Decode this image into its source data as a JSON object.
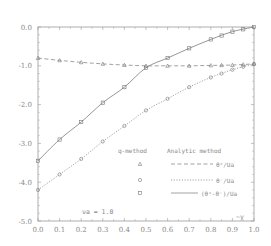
{
  "chart_data": {
    "type": "line",
    "title": "",
    "xlabel": "y",
    "xlabel_display": "~y",
    "ylabel": "",
    "xlim": [
      0.0,
      1.0
    ],
    "ylim": [
      -5.0,
      0.0
    ],
    "grid": false,
    "x_ticks": [
      "0.0",
      "0.1",
      "0.2",
      "0.3",
      "0.4",
      "0.5",
      "0.6",
      "0.7",
      "0.8",
      "0.9",
      "1.0"
    ],
    "y_ticks": [
      "0.0",
      "-1.0",
      "-2.0",
      "-3.0",
      "-4.0",
      "-5.0"
    ],
    "annotation": "νa = 1.0",
    "legend": {
      "position": "lower right",
      "header_left": "q-method",
      "header_right": "Analytic method",
      "entries": [
        {
          "marker": "triangle",
          "line": "dashed",
          "label": "θ⁺/Ua"
        },
        {
          "marker": "circle",
          "line": "dotted",
          "label": "θ⁻/Ua"
        },
        {
          "marker": "square",
          "line": "solid",
          "label": "(θ⁺-θ⁻)/Ua"
        }
      ]
    },
    "x": [
      0.0,
      0.1,
      0.2,
      0.3,
      0.4,
      0.5,
      0.6,
      0.7,
      0.8,
      0.9,
      1.0
    ],
    "series": [
      {
        "name": "θ⁺/Ua",
        "style": "dashed",
        "marker": "triangle",
        "values": [
          -0.8,
          -0.86,
          -0.91,
          -0.95,
          -0.98,
          -1.0,
          -1.0,
          -1.0,
          -0.99,
          -0.98,
          -0.95
        ]
      },
      {
        "name": "θ⁻/Ua",
        "style": "dotted",
        "marker": "circle",
        "values": [
          -4.2,
          -3.8,
          -3.4,
          -2.95,
          -2.55,
          -2.15,
          -1.85,
          -1.55,
          -1.3,
          -1.1,
          -0.95
        ]
      },
      {
        "name": "(θ⁺-θ⁻)/Ua",
        "style": "solid",
        "marker": "square",
        "values": [
          -3.45,
          -2.9,
          -2.45,
          -1.95,
          -1.55,
          -1.05,
          -0.8,
          -0.55,
          -0.32,
          -0.12,
          0.0
        ]
      }
    ]
  }
}
